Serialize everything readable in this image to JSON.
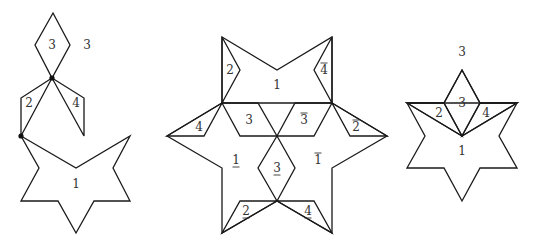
{
  "figures": [
    {
      "name": "left-figure",
      "pieces": [
        {
          "id": "piece-3-diamond",
          "points": "53,13 70,45 52,78 35,45",
          "label": "3",
          "lx": 52,
          "ly": 45,
          "decor": ""
        },
        {
          "id": "piece-2",
          "points": "52,78 21,98 21,136",
          "label": "2",
          "lx": 29,
          "ly": 103,
          "decor": ""
        },
        {
          "id": "piece-4",
          "points": "52,78 84,98 84,136",
          "label": "4",
          "lx": 76,
          "ly": 103,
          "decor": ""
        },
        {
          "id": "piece-1-star",
          "points": "21,136 76,168 130,136 113,168 130,201 94,201 76,233 58,201 21,201 39,168",
          "label": "1",
          "lx": 76,
          "ly": 184,
          "decor": ""
        }
      ],
      "extra_labels": [
        {
          "text": "3",
          "x": 87,
          "y": 45
        }
      ],
      "dots": [
        {
          "x": 52,
          "y": 78
        },
        {
          "x": 21,
          "y": 136
        }
      ]
    },
    {
      "name": "middle-figure",
      "pieces": [
        {
          "id": "outline-star",
          "points": "222,37 277,70 332,37 332,103 387,136 332,168 332,233 277,201 222,233 222,168 167,136 222,103",
          "label": "",
          "lx": 0,
          "ly": 0,
          "decor": ""
        },
        {
          "id": "piece-2-top",
          "points": "222,37 240,70 222,103",
          "label": "2",
          "lx": 230,
          "ly": 70,
          "decor": ""
        },
        {
          "id": "piece-4bar-top",
          "points": "332,37 314,70 332,103",
          "label": "4",
          "lx": 324,
          "ly": 70,
          "decor": "over"
        },
        {
          "id": "center-line",
          "points": "222,103 332,103",
          "label": "1",
          "lx": 277,
          "ly": 85,
          "decor": ""
        },
        {
          "id": "piece-3",
          "points": "222,103 258,103 277,136 240,136",
          "label": "3",
          "lx": 249,
          "ly": 120,
          "decor": ""
        },
        {
          "id": "piece-3bar",
          "points": "332,103 295,103 277,136 314,136",
          "label": "3",
          "lx": 304,
          "ly": 120,
          "decor": "over"
        },
        {
          "id": "piece-4-left",
          "points": "222,103 167,136 204,136",
          "label": "4",
          "lx": 199,
          "ly": 127,
          "decor": ""
        },
        {
          "id": "piece-2bar-right",
          "points": "332,103 387,136 350,136",
          "label": "2",
          "lx": 356,
          "ly": 127,
          "decor": "over"
        },
        {
          "id": "piece-3under-diamond",
          "points": "277,136 295,168 277,201 258,168",
          "label": "3",
          "lx": 277,
          "ly": 168,
          "decor": "under"
        },
        {
          "id": "piece-2under",
          "points": "277,201 240,201 222,233",
          "label": "2",
          "lx": 246,
          "ly": 211,
          "decor": "under"
        },
        {
          "id": "piece-4under",
          "points": "277,201 314,201 332,233",
          "label": "4",
          "lx": 308,
          "ly": 211,
          "decor": "under"
        }
      ],
      "extra_labels": [
        {
          "text": "1",
          "x": 236,
          "y": 160,
          "decor": "under"
        },
        {
          "text": "1",
          "x": 318,
          "y": 160,
          "decor": "over"
        }
      ],
      "dots": []
    },
    {
      "name": "right-figure",
      "pieces": [
        {
          "id": "outline-star",
          "points": "462,70 480,103 517,103 499,136 517,168 480,168 462,201 444,168 407,168 425,136 407,103 444,103",
          "label": "",
          "lx": 0,
          "ly": 0,
          "decor": ""
        },
        {
          "id": "piece-3-diamond",
          "points": "462,70 480,103 462,136 444,103",
          "label": "3",
          "lx": 462,
          "ly": 103,
          "decor": ""
        },
        {
          "id": "piece-2",
          "points": "407,103 444,103 462,136",
          "label": "2",
          "lx": 439,
          "ly": 113,
          "decor": ""
        },
        {
          "id": "piece-4",
          "points": "517,103 480,103 462,136",
          "label": "4",
          "lx": 486,
          "ly": 113,
          "decor": ""
        },
        {
          "id": "piece-1",
          "points": "407,103 462,136 517,103",
          "label": "1",
          "lx": 462,
          "ly": 151,
          "decor": ""
        }
      ],
      "extra_labels": [
        {
          "text": "3",
          "x": 462,
          "y": 52
        }
      ],
      "dots": []
    }
  ]
}
